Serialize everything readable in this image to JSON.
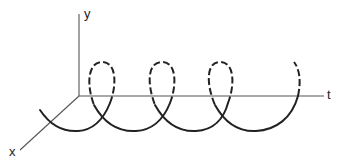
{
  "diagram": {
    "type": "3d-helix-along-time-axis",
    "axes": {
      "y_label": "y",
      "t_label": "t",
      "x_label": "x"
    },
    "helix": {
      "turns": 3.5,
      "front_style": "solid",
      "back_style": "dashed"
    },
    "colors": {
      "axis": "#555555",
      "curve": "#222222",
      "background": "#ffffff"
    }
  }
}
